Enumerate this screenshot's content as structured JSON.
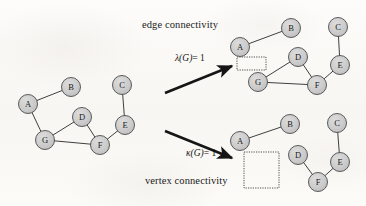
{
  "figure": {
    "type": "graph-connectivity-diagram",
    "background_color": "#fbfaf8",
    "ink_color": "#2a2a2a",
    "node_fill": "#c9c9c9",
    "node_stroke": "#4a4a4a",
    "captions": {
      "edge_connectivity": "edge connectivity",
      "vertex_connectivity": "vertex connectivity"
    },
    "labels": {
      "lambda_value": "= 1",
      "lambda_symbol": "λ(G)",
      "kappa_value": "= 1",
      "kappa_symbol": "κ(G)"
    },
    "arrows": [
      {
        "name": "arrow-to-edge-connectivity",
        "x1": 165,
        "y1": 93,
        "x2": 232,
        "y2": 66
      },
      {
        "name": "arrow-to-vertex-connectivity",
        "x1": 165,
        "y1": 131,
        "x2": 232,
        "y2": 158
      }
    ],
    "graphs": [
      {
        "id": "original-graph",
        "name": "original-graph",
        "caption": "",
        "nodes": [
          {
            "id": "A",
            "label": "A",
            "cx": 28,
            "cy": 104
          },
          {
            "id": "B",
            "label": "B",
            "cx": 71,
            "cy": 87
          },
          {
            "id": "C",
            "label": "C",
            "cx": 122,
            "cy": 85
          },
          {
            "id": "D",
            "label": "D",
            "cx": 82,
            "cy": 117
          },
          {
            "id": "E",
            "label": "E",
            "cx": 125,
            "cy": 125
          },
          {
            "id": "F",
            "label": "F",
            "cx": 100,
            "cy": 145
          },
          {
            "id": "G",
            "label": "G",
            "cx": 45,
            "cy": 140
          }
        ],
        "edges": [
          [
            "A",
            "B"
          ],
          [
            "A",
            "G"
          ],
          [
            "G",
            "D"
          ],
          [
            "G",
            "F"
          ],
          [
            "D",
            "F"
          ],
          [
            "F",
            "E"
          ],
          [
            "E",
            "C"
          ]
        ],
        "cut_box": null
      },
      {
        "id": "edge-cut-graph",
        "name": "edge-cut-graph",
        "caption": "",
        "nodes": [
          {
            "id": "A",
            "label": "A",
            "cx": 240,
            "cy": 47
          },
          {
            "id": "B",
            "label": "B",
            "cx": 291,
            "cy": 28
          },
          {
            "id": "C",
            "label": "C",
            "cx": 338,
            "cy": 27
          },
          {
            "id": "D",
            "label": "D",
            "cx": 298,
            "cy": 57
          },
          {
            "id": "E",
            "label": "E",
            "cx": 340,
            "cy": 65
          },
          {
            "id": "F",
            "label": "F",
            "cx": 317,
            "cy": 85
          },
          {
            "id": "G",
            "label": "G",
            "cx": 258,
            "cy": 82
          }
        ],
        "edges": [
          [
            "A",
            "B"
          ],
          [
            "G",
            "D"
          ],
          [
            "G",
            "F"
          ],
          [
            "D",
            "F"
          ],
          [
            "F",
            "E"
          ],
          [
            "E",
            "C"
          ]
        ],
        "cut_box": {
          "name": "removed-edge-box",
          "x": 237,
          "y": 57,
          "w": 29,
          "h": 13
        }
      },
      {
        "id": "vertex-cut-graph",
        "name": "vertex-cut-graph",
        "caption": "",
        "nodes": [
          {
            "id": "A",
            "label": "A",
            "cx": 240,
            "cy": 141
          },
          {
            "id": "B",
            "label": "B",
            "cx": 290,
            "cy": 124
          },
          {
            "id": "C",
            "label": "C",
            "cx": 337,
            "cy": 123
          },
          {
            "id": "D",
            "label": "D",
            "cx": 298,
            "cy": 155
          },
          {
            "id": "E",
            "label": "E",
            "cx": 340,
            "cy": 162
          },
          {
            "id": "F",
            "label": "F",
            "cx": 318,
            "cy": 182
          }
        ],
        "edges": [
          [
            "A",
            "B"
          ],
          [
            "D",
            "F"
          ],
          [
            "F",
            "E"
          ],
          [
            "E",
            "C"
          ]
        ],
        "cut_box": {
          "name": "removed-vertex-box",
          "x": 244,
          "y": 152,
          "w": 35,
          "h": 36
        }
      }
    ],
    "node_radius": 9.5
  }
}
